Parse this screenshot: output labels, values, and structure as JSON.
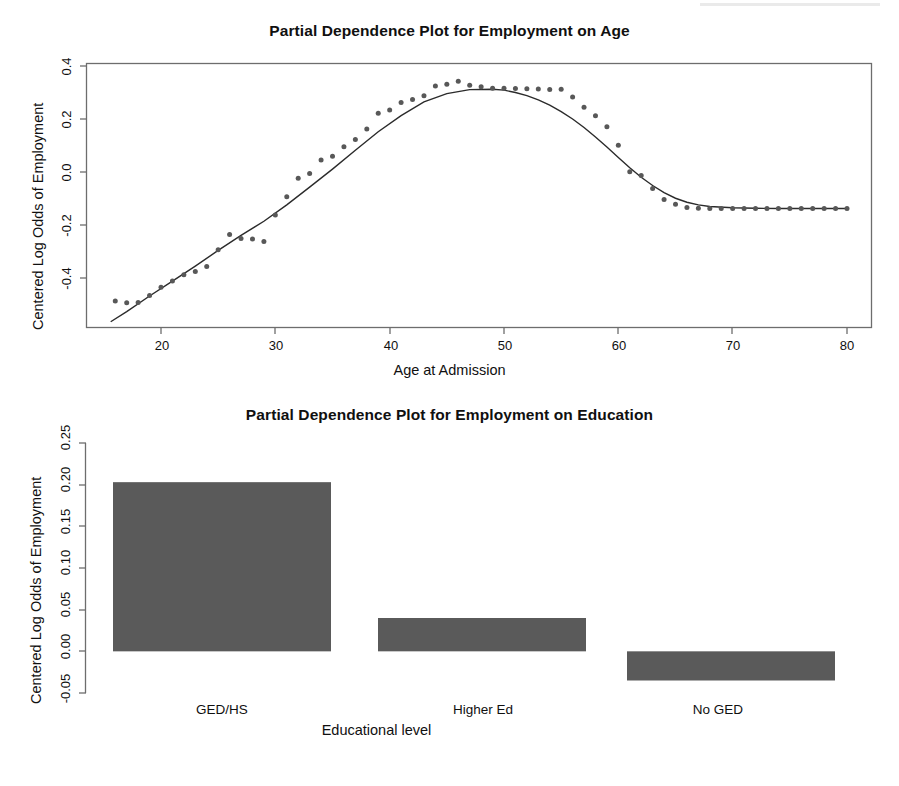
{
  "figure": {
    "width": 899,
    "height": 786,
    "background": "#ffffff",
    "ink_color": "#2b2b2b",
    "bar_fill": "#5a5a5a"
  },
  "chart_data": [
    {
      "id": "age",
      "type": "scatter",
      "title": "Partial Dependence Plot for Employment on Age",
      "xlabel": "Age at Admission",
      "ylabel": "Centered Log Odds of Employment",
      "xlim": [
        15,
        81
      ],
      "ylim": [
        -0.58,
        0.42
      ],
      "grid": false,
      "legend": "none",
      "xticks": [
        20,
        30,
        40,
        50,
        60,
        70,
        80
      ],
      "xtick_labels": [
        "20",
        "30",
        "40",
        "50",
        "60",
        "70",
        "80"
      ],
      "yticks": [
        0.4,
        0.2,
        0.0,
        -0.2,
        -0.4
      ],
      "ytick_labels": [
        "0.4",
        "0.2",
        "0.0",
        "-0.2",
        "-0.4"
      ],
      "series": [
        {
          "name": "partial dependence points",
          "marker": "point",
          "x": [
            16,
            17,
            18,
            19,
            20,
            21,
            22,
            23,
            24,
            25,
            26,
            27,
            28,
            29,
            30,
            31,
            32,
            33,
            34,
            35,
            36,
            37,
            38,
            39,
            40,
            41,
            42,
            43,
            44,
            45,
            46,
            47,
            48,
            49,
            50,
            51,
            52,
            53,
            54,
            55,
            56,
            57,
            58,
            59,
            60,
            61,
            62,
            63,
            64,
            65,
            66,
            67,
            68,
            69,
            70,
            71,
            72,
            73,
            74,
            75,
            76,
            77,
            78,
            79,
            80
          ],
          "y": [
            -0.487,
            -0.493,
            -0.492,
            -0.466,
            -0.435,
            -0.411,
            -0.388,
            -0.375,
            -0.357,
            -0.293,
            -0.236,
            -0.251,
            -0.253,
            -0.262,
            -0.162,
            -0.093,
            -0.024,
            -0.006,
            0.045,
            0.059,
            0.095,
            0.123,
            0.162,
            0.222,
            0.234,
            0.262,
            0.274,
            0.288,
            0.325,
            0.331,
            0.342,
            0.327,
            0.322,
            0.316,
            0.316,
            0.315,
            0.314,
            0.313,
            0.311,
            0.312,
            0.283,
            0.244,
            0.212,
            0.171,
            0.101,
            0.001,
            -0.013,
            -0.062,
            -0.104,
            -0.122,
            -0.134,
            -0.137,
            -0.138,
            -0.138,
            -0.138,
            -0.138,
            -0.138,
            -0.138,
            -0.138,
            -0.138,
            -0.138,
            -0.138,
            -0.138,
            -0.138,
            -0.138
          ]
        },
        {
          "name": "smoothed fit",
          "marker": "line",
          "x": [
            15.6,
            17,
            19,
            21,
            23,
            25,
            27,
            29,
            31,
            33,
            35,
            37,
            39,
            41,
            43,
            45,
            47,
            49,
            50,
            51,
            52,
            53,
            54,
            55,
            56,
            57,
            58,
            59,
            60,
            61,
            62,
            63,
            64,
            65,
            66,
            67,
            68,
            70,
            72,
            74,
            76,
            78,
            80
          ],
          "y": [
            -0.565,
            -0.527,
            -0.468,
            -0.412,
            -0.355,
            -0.296,
            -0.239,
            -0.186,
            -0.124,
            -0.057,
            0.011,
            0.082,
            0.152,
            0.213,
            0.265,
            0.296,
            0.311,
            0.312,
            0.309,
            0.3,
            0.288,
            0.272,
            0.252,
            0.228,
            0.2,
            0.168,
            0.132,
            0.094,
            0.055,
            0.016,
            -0.02,
            -0.051,
            -0.078,
            -0.099,
            -0.114,
            -0.124,
            -0.13,
            -0.135,
            -0.137,
            -0.138,
            -0.138,
            -0.138,
            -0.138
          ]
        }
      ]
    },
    {
      "id": "education",
      "type": "bar",
      "title": "Partial Dependence Plot for Employment on Education",
      "xlabel": "Educational level",
      "ylabel": "Centered Log Odds of Employment",
      "categories": [
        "GED/HS",
        "Higher Ed",
        "No GED"
      ],
      "values": [
        0.203,
        0.04,
        -0.035
      ],
      "baseline": 0.0,
      "ylim": [
        -0.068,
        0.262
      ],
      "grid": false,
      "legend": "none",
      "yticks": [
        0.25,
        0.2,
        0.15,
        0.1,
        0.05,
        0.0,
        -0.05
      ],
      "ytick_labels": [
        "0.25",
        "0.20",
        "0.15",
        "0.10",
        "0.05",
        "0.00",
        "-0.05"
      ]
    }
  ]
}
